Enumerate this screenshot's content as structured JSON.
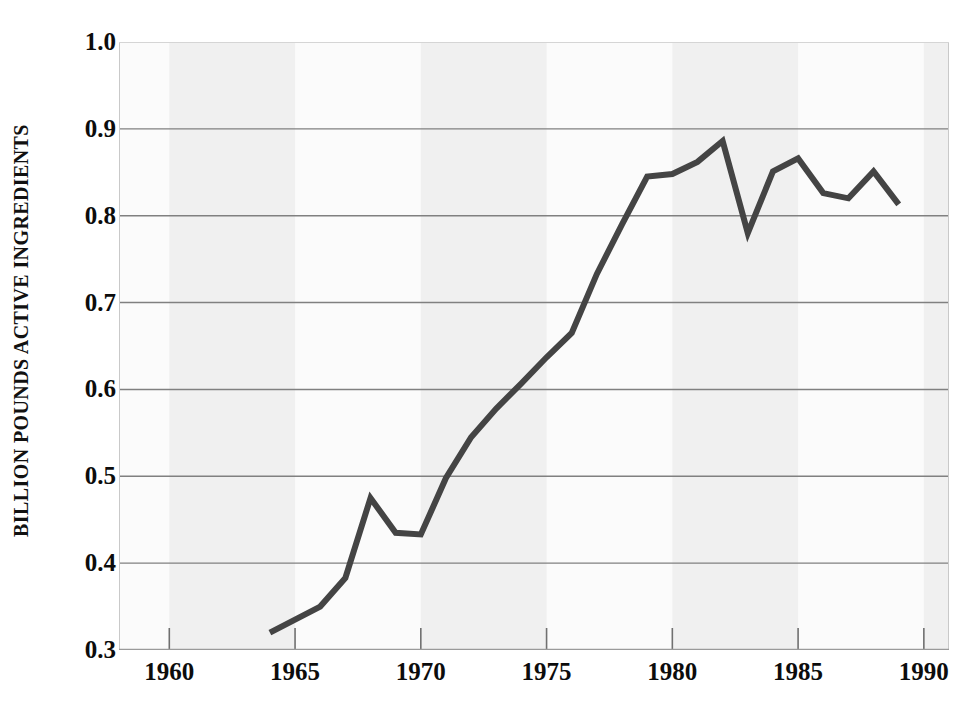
{
  "figure": {
    "top_caption_fragment": "",
    "background_color": "#ffffff"
  },
  "chart_data": {
    "type": "line",
    "title": "",
    "xlabel": "",
    "ylabel": "BILLION POUNDS ACTIVE INGREDIENTS",
    "xlim": [
      1958,
      1991
    ],
    "ylim": [
      0.3,
      1.0
    ],
    "xticks": [
      1960,
      1965,
      1970,
      1975,
      1980,
      1985,
      1990
    ],
    "xtick_labels": [
      "1960",
      "1965",
      "1970",
      "1975",
      "1980",
      "1985",
      "1990"
    ],
    "yticks": [
      0.3,
      0.4,
      0.5,
      0.6,
      0.7,
      0.8,
      0.9,
      1.0
    ],
    "ytick_labels": [
      "0.3",
      "0.4",
      "0.5",
      "0.6",
      "0.7",
      "0.8",
      "0.9",
      "1.0"
    ],
    "grid": "horizontal",
    "gridline_values": [
      0.4,
      0.5,
      0.6,
      0.7,
      0.8,
      0.9
    ],
    "legend": "none",
    "line_color": "#444444",
    "line_width": 6,
    "grid_color": "#808080",
    "plot_background": "#fbfbfb",
    "band_color": "#f0f0f0",
    "x": [
      1964,
      1965,
      1966,
      1967,
      1968,
      1969,
      1970,
      1971,
      1972,
      1973,
      1974,
      1975,
      1976,
      1977,
      1978,
      1979,
      1980,
      1981,
      1982,
      1983,
      1984,
      1985,
      1986,
      1987,
      1988,
      1989
    ],
    "values": [
      0.32,
      0.335,
      0.35,
      0.383,
      0.475,
      0.435,
      0.433,
      0.498,
      0.545,
      0.578,
      0.607,
      0.637,
      0.665,
      0.733,
      0.79,
      0.845,
      0.848,
      0.862,
      0.886,
      0.78,
      0.851,
      0.866,
      0.826,
      0.82,
      0.851,
      0.813
    ],
    "series": [
      {
        "name": "Pesticide use",
        "values": [
          0.32,
          0.335,
          0.35,
          0.383,
          0.475,
          0.435,
          0.433,
          0.498,
          0.545,
          0.578,
          0.607,
          0.637,
          0.665,
          0.733,
          0.79,
          0.845,
          0.848,
          0.862,
          0.886,
          0.78,
          0.851,
          0.866,
          0.826,
          0.82,
          0.851,
          0.813
        ]
      }
    ]
  }
}
